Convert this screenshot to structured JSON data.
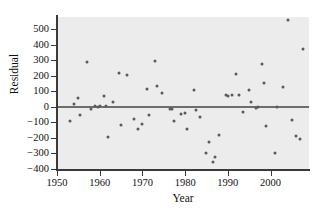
{
  "chart_data": {
    "type": "scatter",
    "title": "",
    "xlabel": "Year",
    "ylabel": "Residual",
    "xlim": [
      1950,
      2009
    ],
    "ylim": [
      -400,
      580
    ],
    "grid": false,
    "legend": null,
    "annotations": [
      {
        "name": "zero-reference-line",
        "y": 0
      }
    ],
    "xticks": [
      1950,
      1960,
      1970,
      1980,
      1990,
      2000
    ],
    "xtick_labels": [
      "1950",
      "1960",
      "1970",
      "1980",
      "1990",
      "2000"
    ],
    "yticks": [
      -400,
      -300,
      -200,
      -100,
      0,
      100,
      200,
      300,
      400,
      500
    ],
    "ytick_labels": [
      "−400",
      "−300",
      "−200",
      "−100",
      "0",
      "100",
      "200",
      "300",
      "400",
      "500"
    ],
    "marker": {
      "shape": "circle",
      "size": 3,
      "color": "#5a5a5a"
    },
    "panel_background": "#ececec",
    "points": [
      {
        "x": 1953,
        "y": -90
      },
      {
        "x": 1954,
        "y": 20
      },
      {
        "x": 1955,
        "y": 55
      },
      {
        "x": 1955.5,
        "y": -55
      },
      {
        "x": 1957,
        "y": 288
      },
      {
        "x": 1958,
        "y": -10
      },
      {
        "x": 1959,
        "y": 5
      },
      {
        "x": 1959.5,
        "y": 0
      },
      {
        "x": 1960,
        "y": 5
      },
      {
        "x": 1961,
        "y": 70
      },
      {
        "x": 1961.5,
        "y": 8
      },
      {
        "x": 1962,
        "y": -195
      },
      {
        "x": 1963,
        "y": 33
      },
      {
        "x": 1964.5,
        "y": 220
      },
      {
        "x": 1965,
        "y": -118
      },
      {
        "x": 1966.5,
        "y": 208
      },
      {
        "x": 1968,
        "y": -75
      },
      {
        "x": 1969,
        "y": -143
      },
      {
        "x": 1969.8,
        "y": -108
      },
      {
        "x": 1971,
        "y": 115
      },
      {
        "x": 1971.5,
        "y": -55
      },
      {
        "x": 1973,
        "y": 297
      },
      {
        "x": 1973.5,
        "y": 132
      },
      {
        "x": 1974.5,
        "y": 88
      },
      {
        "x": 1976.5,
        "y": -13
      },
      {
        "x": 1977,
        "y": -12
      },
      {
        "x": 1977.5,
        "y": -88
      },
      {
        "x": 1979,
        "y": -45
      },
      {
        "x": 1980,
        "y": -42
      },
      {
        "x": 1980.5,
        "y": -140
      },
      {
        "x": 1982,
        "y": 108
      },
      {
        "x": 1982.5,
        "y": -20
      },
      {
        "x": 1983.5,
        "y": -62
      },
      {
        "x": 1985,
        "y": -300
      },
      {
        "x": 1985.5,
        "y": -228
      },
      {
        "x": 1986.5,
        "y": -352
      },
      {
        "x": 1987,
        "y": -320
      },
      {
        "x": 1988,
        "y": -183
      },
      {
        "x": 1989.5,
        "y": 80
      },
      {
        "x": 1990,
        "y": 70
      },
      {
        "x": 1991,
        "y": 75
      },
      {
        "x": 1992,
        "y": 215
      },
      {
        "x": 1992.5,
        "y": 80
      },
      {
        "x": 1993.5,
        "y": -30
      },
      {
        "x": 1995,
        "y": 108
      },
      {
        "x": 1995.5,
        "y": 32
      },
      {
        "x": 1996.5,
        "y": -5
      },
      {
        "x": 1997,
        "y": 2
      },
      {
        "x": 1998,
        "y": 280
      },
      {
        "x": 1998.5,
        "y": 155
      },
      {
        "x": 1999,
        "y": -125
      },
      {
        "x": 2001,
        "y": -295
      },
      {
        "x": 2001.5,
        "y": 0
      },
      {
        "x": 2003,
        "y": 128
      },
      {
        "x": 2004,
        "y": 560
      },
      {
        "x": 2005,
        "y": -82
      },
      {
        "x": 2006,
        "y": -190
      },
      {
        "x": 2006.8,
        "y": -208
      },
      {
        "x": 2007.5,
        "y": 372
      }
    ]
  }
}
